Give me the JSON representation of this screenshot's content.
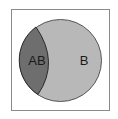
{
  "diagram": {
    "type": "venn",
    "frame": {
      "stroke": "#8a8a8a",
      "fill": "#ffffff"
    },
    "regions": [
      {
        "id": "B",
        "label": "B",
        "fill": "#b8b8b8",
        "stroke": "#555555"
      },
      {
        "id": "AB",
        "label": "AB",
        "fill": "#6e6e6e",
        "stroke": "#2a2a2a"
      }
    ]
  }
}
